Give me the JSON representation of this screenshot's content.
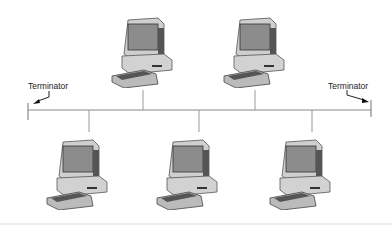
{
  "diagram": {
    "labels": {
      "terminator_left": "Terminator",
      "terminator_right": "Terminator"
    },
    "bus": {
      "x1": 28,
      "x2": 371,
      "y": 110
    },
    "nodes": [
      {
        "id": "pc-top-1",
        "row": "top",
        "x": 110,
        "y": 10,
        "drop_x": 143
      },
      {
        "id": "pc-top-2",
        "row": "top",
        "x": 222,
        "y": 10,
        "drop_x": 255
      },
      {
        "id": "pc-bottom-1",
        "row": "bottom",
        "x": 45,
        "y": 128,
        "drop_x": 89
      },
      {
        "id": "pc-bottom-2",
        "row": "bottom",
        "x": 155,
        "y": 128,
        "drop_x": 199
      },
      {
        "id": "pc-bottom-3",
        "row": "bottom",
        "x": 268,
        "y": 128,
        "drop_x": 312
      }
    ],
    "colors": {
      "line": "#888888",
      "pc_body": "#d8d8d8",
      "screen": "#9a9a9a",
      "dark": "#444444"
    }
  }
}
